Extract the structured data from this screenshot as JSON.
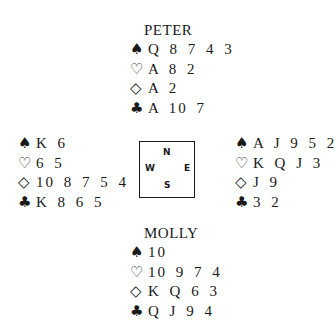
{
  "north": {
    "name": "PETER",
    "spades": "Q 8 7 4 3",
    "hearts": "A 8 2",
    "diamonds": "A 2",
    "clubs": "A 10 7"
  },
  "west": {
    "spades": "K 6",
    "hearts": "6 5",
    "diamonds": "10 8 7 5 4",
    "clubs": "K 8 6 5"
  },
  "east": {
    "spades": "A J 9 5 2",
    "hearts": "K Q J 3",
    "diamonds": "J 9",
    "clubs": "3 2"
  },
  "south": {
    "name": "MOLLY",
    "spades": "10",
    "hearts": "10 9 7 4",
    "diamonds": "K Q 6 3",
    "clubs": "Q J 9 4"
  },
  "compass": {
    "n": "N",
    "s": "S",
    "w": "W",
    "e": "E"
  },
  "suits": {
    "spades": "♠",
    "hearts": "♡",
    "diamonds": "◇",
    "clubs": "♣"
  }
}
